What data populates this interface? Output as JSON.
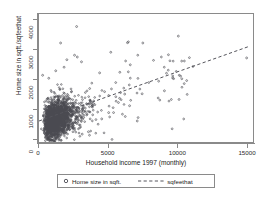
{
  "chart_data": {
    "type": "scatter",
    "title": "",
    "xlabel": "Household income 1997 (monthly)",
    "ylabel": "Home size in sqft./sqfeethat",
    "xlim": [
      0,
      15500
    ],
    "ylim": [
      -150,
      4200
    ],
    "xticks": [
      0,
      5000,
      10000,
      15000
    ],
    "xtick_labels": [
      "0",
      "5000",
      "10000",
      "15000"
    ],
    "yticks": [
      0,
      1000,
      2000,
      3000,
      4000
    ],
    "ytick_labels": [
      "0",
      "1000",
      "2000",
      "3000",
      "4000"
    ],
    "grid": false,
    "legend_position": "below",
    "marker_color": "#4a4a52",
    "line_color": "#55555c",
    "frame_color": "#8a8a8a",
    "series": [
      {
        "name": "Home size in sqft.",
        "type": "scatter",
        "marker": "open-circle",
        "n_points": 1000,
        "description": "Dense cloud of households concentrated between income 200-4000 and home size 200-2000 sqft, with a long right tail of sparse high-income observations extending to 15000.",
        "notable_points": [
          [
            2700,
            3780
          ],
          [
            1550,
            3230
          ],
          [
            6350,
            3240
          ],
          [
            7450,
            3230
          ],
          [
            10000,
            3460
          ],
          [
            14900,
            2730
          ],
          [
            2000,
            2670
          ],
          [
            2550,
            2820
          ],
          [
            2750,
            2760
          ],
          [
            3050,
            2600
          ],
          [
            5150,
            2920
          ],
          [
            6550,
            2500
          ],
          [
            5800,
            2250
          ],
          [
            4350,
            2230
          ],
          [
            9000,
            1630
          ],
          [
            10050,
            1340
          ],
          [
            7400,
            1530
          ],
          [
            6150,
            1520
          ],
          [
            6500,
            1130
          ],
          [
            7050,
            620
          ],
          [
            3100,
            180
          ],
          [
            3550,
            260
          ],
          [
            4500,
            690
          ],
          [
            5000,
            900
          ],
          [
            260,
            2150
          ],
          [
            700,
            2050
          ],
          [
            1200,
            2300
          ],
          [
            1800,
            2420
          ]
        ]
      },
      {
        "name": "sqfeethat",
        "type": "line",
        "style": "dashed",
        "description": "Linear fitted values of home size on household income",
        "endpoints": [
          [
            0,
            620
          ],
          [
            15100,
            3120
          ]
        ],
        "intercept": 620,
        "slope": 0.1656
      }
    ],
    "legend": [
      {
        "label": "Home size in sqft.",
        "marker": "open-circle"
      },
      {
        "label": "sqfeethat",
        "marker": "dashed-line"
      }
    ]
  },
  "axis": {
    "y_title": "Home size in sqft./sqfeethat",
    "x_title": "Household income 1997 (monthly)"
  },
  "legend": {
    "scatter_label": "Home size in sqft.",
    "fit_label": "sqfeethat"
  }
}
